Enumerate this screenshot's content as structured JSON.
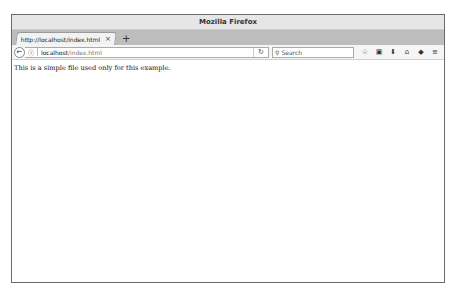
{
  "window": {
    "title": "Mozilla Firefox"
  },
  "tabs": [
    {
      "label": "http://localhost/index.html",
      "close_icon": "×"
    }
  ],
  "new_tab_icon": "+",
  "navbar": {
    "back_icon": "←",
    "info_icon": "ⓘ",
    "url_host": "localhost",
    "url_path": "/index.html",
    "reload_icon": "↻",
    "search_placeholder": "Search",
    "search_icon": "🔍"
  },
  "toolbar_icons": [
    {
      "name": "bookmark-star-icon",
      "glyph": "☆"
    },
    {
      "name": "reading-list-icon",
      "glyph": "▣"
    },
    {
      "name": "downloads-icon",
      "glyph": "⬇"
    },
    {
      "name": "home-icon",
      "glyph": "⌂"
    },
    {
      "name": "pocket-icon",
      "glyph": "◆"
    },
    {
      "name": "menu-icon",
      "glyph": "≡"
    }
  ],
  "page": {
    "text": "This is a simple file used only for this example."
  }
}
